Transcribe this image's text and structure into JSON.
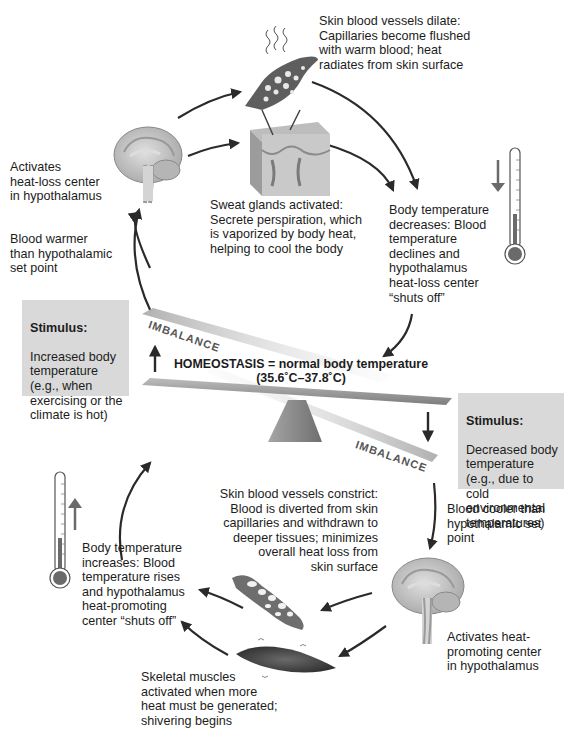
{
  "diagram": {
    "homeostasis": {
      "line1": "HOMEOSTASIS = normal body temperature",
      "line2": "(35.6˚C–37.8˚C)"
    },
    "imbalance_top": "IMBALANCE",
    "imbalance_bottom": "IMBALANCE",
    "top_loop": {
      "stimulus": {
        "title": "Stimulus:",
        "text": "Increased body\ntemperature\n(e.g., when\nexercising or the\nclimate is hot)"
      },
      "blood_state": "Blood warmer\nthan hypothalamic\nset point",
      "control_center": "Activates\nheat-loss center\nin hypothalamus",
      "effector_vessels": "Skin blood vessels dilate:\nCapillaries become flushed\nwith warm blood; heat\nradiates from skin surface",
      "effector_sweat": "Sweat glands activated:\nSecrete perspiration, which\nis vaporized by body heat,\nhelping to cool the body",
      "result": "Body temperature\ndecreases: Blood\ntemperature\ndeclines and\nhypothalamus\nheat-loss center\n“shuts off”",
      "thermometer_direction": "down"
    },
    "bottom_loop": {
      "stimulus": {
        "title": "Stimulus:",
        "text": "Decreased body\ntemperature\n(e.g., due to cold\nenvironmental\ntemperatures)"
      },
      "blood_state": "Blood cooler than\nhypothalamic set\npoint",
      "control_center": "Activates heat-\npromoting center\nin hypothalamus",
      "effector_vessels": "Skin blood vessels constrict:\nBlood is diverted from skin\ncapillaries and withdrawn to\ndeeper tissues; minimizes\noverall heat loss from\nskin surface",
      "effector_muscles": "Skeletal muscles\nactivated when more\nheat must be generated;\nshivering begins",
      "result": "Body temperature\nincreases: Blood\ntemperature rises\nand hypothalamus\nheat-promoting\ncenter “shuts off”",
      "thermometer_direction": "up"
    },
    "colors": {
      "stimulus_box": "#d9d9d9",
      "arrow": "#2a2a2a",
      "beam": "#9a9a9a",
      "fulcrum": "#8c8c8c",
      "brain": "#c8c8c8",
      "vessel": "#6e6e6e"
    }
  }
}
